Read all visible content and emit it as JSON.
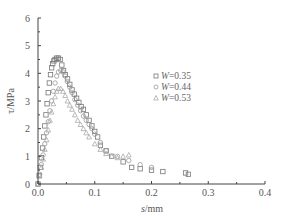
{
  "chart_data": {
    "type": "scatter",
    "title": "",
    "xlabel": "s/mm",
    "ylabel": "τ/MPa",
    "xlim": [
      0,
      0.4
    ],
    "ylim": [
      0,
      6
    ],
    "xticks": [
      "0.0",
      "0.1",
      "0.2",
      "0.3",
      "0.4"
    ],
    "yticks": [
      "0",
      "1",
      "2",
      "3",
      "4",
      "5",
      "6"
    ],
    "grid": false,
    "legend_position": "upper right (inside)",
    "series": [
      {
        "name": "W=0.35",
        "marker": "square",
        "color": "#777777",
        "x": [
          0.0,
          0.002,
          0.004,
          0.006,
          0.008,
          0.01,
          0.012,
          0.014,
          0.016,
          0.018,
          0.02,
          0.022,
          0.024,
          0.026,
          0.028,
          0.03,
          0.033,
          0.036,
          0.039,
          0.042,
          0.045,
          0.048,
          0.052,
          0.056,
          0.06,
          0.064,
          0.068,
          0.072,
          0.076,
          0.08,
          0.085,
          0.09,
          0.095,
          0.1,
          0.105,
          0.11,
          0.12,
          0.13,
          0.15,
          0.165,
          0.18,
          0.2,
          0.22,
          0.26,
          0.265
        ],
        "y": [
          0.0,
          0.3,
          0.6,
          0.95,
          1.3,
          1.7,
          2.1,
          2.5,
          2.9,
          3.3,
          3.65,
          3.95,
          4.2,
          4.35,
          4.45,
          4.5,
          4.55,
          4.55,
          4.5,
          4.3,
          4.1,
          3.95,
          3.8,
          3.6,
          3.4,
          3.25,
          3.1,
          2.95,
          2.8,
          2.7,
          2.5,
          2.3,
          2.1,
          1.9,
          1.7,
          1.4,
          1.2,
          1.0,
          0.8,
          0.6,
          0.55,
          0.5,
          0.45,
          0.4,
          0.35
        ]
      },
      {
        "name": "W=0.44",
        "marker": "circle",
        "color": "#999999",
        "x": [
          0.0,
          0.003,
          0.006,
          0.009,
          0.012,
          0.015,
          0.018,
          0.021,
          0.024,
          0.027,
          0.03,
          0.033,
          0.036,
          0.04,
          0.044,
          0.048,
          0.052,
          0.056,
          0.06,
          0.065,
          0.07,
          0.075,
          0.08,
          0.085,
          0.09,
          0.095,
          0.1,
          0.11,
          0.12,
          0.14,
          0.16,
          0.18,
          0.2
        ],
        "y": [
          0.0,
          0.35,
          0.7,
          1.05,
          1.45,
          1.85,
          2.25,
          2.65,
          3.0,
          3.35,
          3.65,
          3.9,
          4.05,
          4.1,
          4.05,
          3.9,
          3.7,
          3.5,
          3.3,
          3.05,
          2.85,
          2.65,
          2.45,
          2.3,
          2.15,
          2.0,
          1.8,
          1.5,
          1.2,
          1.0,
          0.85,
          0.7,
          0.6
        ]
      },
      {
        "name": "W=0.53",
        "marker": "triangle",
        "color": "#aaaaaa",
        "x": [
          0.0,
          0.003,
          0.006,
          0.009,
          0.012,
          0.015,
          0.018,
          0.021,
          0.024,
          0.027,
          0.03,
          0.033,
          0.036,
          0.04,
          0.044,
          0.048,
          0.052,
          0.056,
          0.06,
          0.065,
          0.07,
          0.075,
          0.08,
          0.085,
          0.09,
          0.1,
          0.11,
          0.12,
          0.13,
          0.14,
          0.15,
          0.16
        ],
        "y": [
          0.0,
          0.3,
          0.6,
          0.9,
          1.25,
          1.6,
          1.95,
          2.3,
          2.6,
          2.9,
          3.15,
          3.35,
          3.45,
          3.45,
          3.35,
          3.2,
          3.0,
          2.85,
          2.7,
          2.5,
          2.3,
          2.15,
          2.0,
          1.85,
          1.7,
          1.45,
          1.25,
          1.1,
          1.0,
          0.95,
          1.0,
          1.05
        ]
      }
    ]
  },
  "legend": {
    "items": [
      {
        "symbol": "□",
        "prefix": "W",
        "label": "=0.35"
      },
      {
        "symbol": "○",
        "prefix": "W",
        "label": "=0.44"
      },
      {
        "symbol": "△",
        "prefix": "W",
        "label": "=0.53"
      }
    ]
  },
  "axes": {
    "xlabel_italic": "s",
    "xlabel_unit": "/mm",
    "ylabel": "τ/MPa"
  }
}
